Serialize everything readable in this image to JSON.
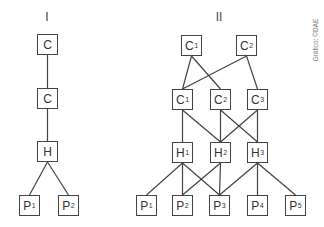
{
  "credit": "Gráfico: ©DAE",
  "diagrams": [
    {
      "label": "I",
      "label_pos": [
        47,
        10
      ],
      "nodes": [
        {
          "id": "c_top",
          "letter": "C",
          "sub": "",
          "x": 37,
          "y": 34
        },
        {
          "id": "c_mid",
          "letter": "C",
          "sub": "",
          "x": 37,
          "y": 88
        },
        {
          "id": "h",
          "letter": "H",
          "sub": "",
          "x": 37,
          "y": 141
        },
        {
          "id": "p1",
          "letter": "P",
          "sub": "1",
          "x": 19,
          "y": 195
        },
        {
          "id": "p2",
          "letter": "P",
          "sub": "2",
          "x": 58,
          "y": 195
        }
      ],
      "edges": [
        [
          "c_top",
          "c_mid"
        ],
        [
          "c_mid",
          "h"
        ],
        [
          "h",
          "p1"
        ],
        [
          "h",
          "p2"
        ]
      ]
    },
    {
      "label": "II",
      "label_pos": [
        219,
        10
      ],
      "nodes": [
        {
          "id": "tc1",
          "letter": "C",
          "sub": "1",
          "x": 181,
          "y": 35
        },
        {
          "id": "tc2",
          "letter": "C",
          "sub": "2",
          "x": 236,
          "y": 35
        },
        {
          "id": "mc1",
          "letter": "C",
          "sub": "1",
          "x": 172,
          "y": 89
        },
        {
          "id": "mc2",
          "letter": "C",
          "sub": "2",
          "x": 210,
          "y": 89
        },
        {
          "id": "mc3",
          "letter": "C",
          "sub": "3",
          "x": 247,
          "y": 89
        },
        {
          "id": "h1",
          "letter": "H",
          "sub": "1",
          "x": 172,
          "y": 142
        },
        {
          "id": "h2",
          "letter": "H",
          "sub": "2",
          "x": 210,
          "y": 142
        },
        {
          "id": "h3",
          "letter": "H",
          "sub": "3",
          "x": 247,
          "y": 142
        },
        {
          "id": "p1",
          "letter": "P",
          "sub": "1",
          "x": 136,
          "y": 195
        },
        {
          "id": "p2",
          "letter": "P",
          "sub": "2",
          "x": 172,
          "y": 195
        },
        {
          "id": "p3",
          "letter": "P",
          "sub": "3",
          "x": 209,
          "y": 195
        },
        {
          "id": "p4",
          "letter": "P",
          "sub": "4",
          "x": 247,
          "y": 195
        },
        {
          "id": "p5",
          "letter": "P",
          "sub": "5",
          "x": 285,
          "y": 195
        }
      ],
      "edges": [
        [
          "tc1",
          "mc1"
        ],
        [
          "tc1",
          "mc2"
        ],
        [
          "tc2",
          "mc1"
        ],
        [
          "tc2",
          "mc3"
        ],
        [
          "mc1",
          "h1"
        ],
        [
          "mc1",
          "h2"
        ],
        [
          "mc2",
          "h2"
        ],
        [
          "mc2",
          "h3"
        ],
        [
          "mc3",
          "h2"
        ],
        [
          "mc3",
          "h3"
        ],
        [
          "h1",
          "p1"
        ],
        [
          "h1",
          "p2"
        ],
        [
          "h1",
          "p3"
        ],
        [
          "h2",
          "p2"
        ],
        [
          "h2",
          "p3"
        ],
        [
          "h3",
          "p3"
        ],
        [
          "h3",
          "p4"
        ],
        [
          "h3",
          "p5"
        ]
      ]
    }
  ],
  "box_size": 21,
  "line_color": "#444444"
}
